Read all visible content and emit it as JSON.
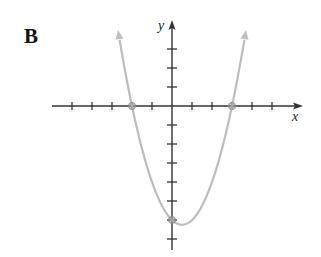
{
  "panel": {
    "label": "B"
  },
  "chart_data": {
    "type": "line",
    "title": "",
    "xlabel": "x",
    "ylabel": "y",
    "function": "y = x^2 - x - 6",
    "x_intercepts": [
      -2,
      3
    ],
    "y_intercept": -6,
    "vertex": [
      0.5,
      -6.25
    ],
    "xlim": [
      -6,
      6.4
    ],
    "ylim": [
      -7.5,
      4.4
    ],
    "x_ticks": [
      -5,
      -4,
      -3,
      -2,
      -1,
      1,
      2,
      3,
      4,
      5
    ],
    "y_ticks": [
      -7,
      -6,
      -5,
      -4,
      -3,
      -2,
      -1,
      1,
      2,
      3
    ],
    "tick_labels_shown": false,
    "grid": false,
    "highlighted_points": [
      [
        -2,
        0
      ],
      [
        3,
        0
      ],
      [
        0,
        -6
      ]
    ],
    "curve_color": "#bdbdbd",
    "axis_color": "#333333",
    "arrows_on_curve_ends": true
  }
}
